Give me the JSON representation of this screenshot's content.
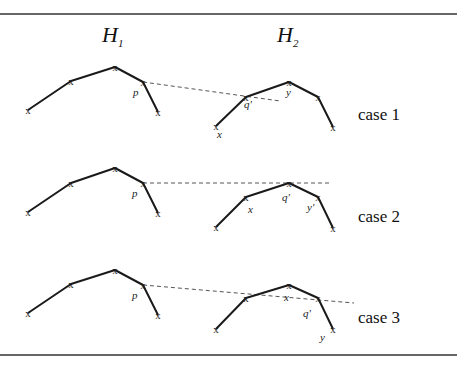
{
  "headers": {
    "h1": {
      "letter": "H",
      "subscript": "1"
    },
    "h2": {
      "letter": "H",
      "subscript": "2"
    }
  },
  "marker_glyph": "x",
  "cases": [
    {
      "label": "case 1",
      "h1_points": [
        [
          28,
          110
        ],
        [
          71,
          81
        ],
        [
          115,
          67
        ],
        [
          143,
          82
        ],
        [
          158,
          112
        ]
      ],
      "h2_points": [
        [
          216,
          126
        ],
        [
          246,
          97
        ],
        [
          289,
          82
        ],
        [
          318,
          97
        ],
        [
          333,
          127
        ]
      ],
      "dashed": [
        [
          143,
          82
        ],
        [
          280,
          101
        ]
      ],
      "labels": [
        {
          "text": "p",
          "x": 133,
          "y": 96
        },
        {
          "text": "q'",
          "x": 244,
          "y": 108
        },
        {
          "text": "y",
          "x": 286,
          "y": 96
        },
        {
          "text": "x",
          "x": 217,
          "y": 138
        }
      ]
    },
    {
      "label": "case 2",
      "h1_points": [
        [
          28,
          212
        ],
        [
          71,
          183
        ],
        [
          115,
          168
        ],
        [
          143,
          183
        ],
        [
          158,
          213
        ]
      ],
      "h2_points": [
        [
          216,
          227
        ],
        [
          246,
          197
        ],
        [
          289,
          183
        ],
        [
          318,
          197
        ],
        [
          333,
          228
        ]
      ],
      "dashed": [
        [
          143,
          183
        ],
        [
          330,
          183
        ]
      ],
      "labels": [
        {
          "text": "p",
          "x": 132,
          "y": 197
        },
        {
          "text": "x",
          "x": 248,
          "y": 213
        },
        {
          "text": "q'",
          "x": 282,
          "y": 201
        },
        {
          "text": "y'",
          "x": 307,
          "y": 211
        }
      ]
    },
    {
      "label": "case 3",
      "h1_points": [
        [
          28,
          313
        ],
        [
          71,
          284
        ],
        [
          115,
          270
        ],
        [
          143,
          285
        ],
        [
          158,
          315
        ]
      ],
      "h2_points": [
        [
          216,
          329
        ],
        [
          246,
          298
        ],
        [
          289,
          285
        ],
        [
          318,
          298
        ],
        [
          333,
          329
        ]
      ],
      "dashed": [
        [
          143,
          285
        ],
        [
          354,
          303
        ]
      ],
      "labels": [
        {
          "text": "p",
          "x": 132,
          "y": 299
        },
        {
          "text": "x",
          "x": 284,
          "y": 301
        },
        {
          "text": "q'",
          "x": 303,
          "y": 317
        },
        {
          "text": "y",
          "x": 320,
          "y": 341
        }
      ]
    }
  ]
}
